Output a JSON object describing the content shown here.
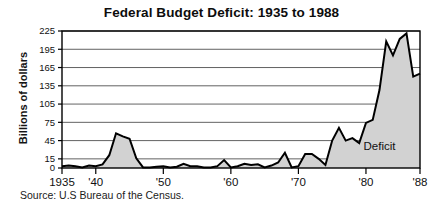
{
  "chart_data": {
    "type": "area",
    "title": "Federal Budget Deficit: 1935 to 1988",
    "xlabel": "",
    "ylabel": "Billions of dollars",
    "source": "Source: U.S Bureau of the Census.",
    "series_label": "Deficit",
    "grid": true,
    "legend_position": "inline-annotation",
    "xlim": [
      1935,
      1988
    ],
    "ylim": [
      0,
      225
    ],
    "yticks": [
      0,
      15,
      45,
      75,
      105,
      135,
      165,
      195,
      225
    ],
    "ytick_labels": [
      "0",
      "15",
      "45",
      "75",
      "105",
      "135",
      "165",
      "195",
      "225"
    ],
    "xticks": [
      1935,
      1940,
      1950,
      1960,
      1970,
      1980,
      1988
    ],
    "xtick_labels": [
      "1935",
      "'40",
      "'50",
      "'60",
      "'70",
      "'80",
      "'88"
    ],
    "x": [
      1935,
      1936,
      1937,
      1938,
      1939,
      1940,
      1941,
      1942,
      1943,
      1944,
      1945,
      1946,
      1947,
      1948,
      1949,
      1950,
      1951,
      1952,
      1953,
      1954,
      1955,
      1956,
      1957,
      1958,
      1959,
      1960,
      1961,
      1962,
      1963,
      1964,
      1965,
      1966,
      1967,
      1968,
      1969,
      1970,
      1971,
      1972,
      1973,
      1974,
      1975,
      1976,
      1977,
      1978,
      1979,
      1980,
      1981,
      1982,
      1983,
      1984,
      1985,
      1986,
      1987,
      1988
    ],
    "values": [
      3,
      4,
      3,
      1,
      4,
      3,
      6,
      21,
      57,
      52,
      48,
      16,
      1,
      1,
      2,
      3,
      1,
      2,
      7,
      3,
      3,
      1,
      1,
      3,
      13,
      1,
      3,
      7,
      5,
      6,
      1,
      4,
      9,
      25,
      1,
      3,
      23,
      23,
      15,
      5,
      45,
      66,
      45,
      49,
      41,
      74,
      79,
      128,
      208,
      185,
      212,
      221,
      150,
      155
    ],
    "annotations": [
      {
        "text": "Deficit",
        "x": 1982,
        "y": 30
      }
    ]
  }
}
